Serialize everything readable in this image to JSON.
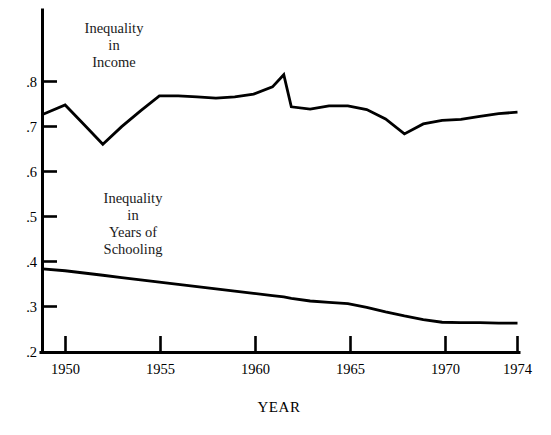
{
  "chart_data": {
    "type": "line",
    "title": "",
    "xlabel": "YEAR",
    "ylabel": "",
    "grid": false,
    "legend_position": "inline-annotation",
    "xlim": [
      1948.8,
      1974
    ],
    "ylim": [
      0.2,
      0.85
    ],
    "x_ticks": [
      1950,
      1955,
      1960,
      1965,
      1970,
      1974
    ],
    "x_tick_labels": [
      "1950",
      "1955",
      "1960",
      "1965",
      "1970",
      "1974"
    ],
    "y_ticks": [
      0.2,
      0.3,
      0.4,
      0.5,
      0.6,
      0.7,
      0.8
    ],
    "y_tick_labels": [
      ".2",
      ".3",
      ".4",
      ".5",
      ".6",
      ".7",
      ".8"
    ],
    "x": [
      1948.8,
      1950,
      1951,
      1952,
      1953,
      1954,
      1955,
      1956,
      1957,
      1958,
      1959,
      1960,
      1961,
      1961.6,
      1962,
      1963,
      1964,
      1965,
      1966,
      1967,
      1968,
      1969,
      1970,
      1971,
      1972,
      1973,
      1974
    ],
    "series": [
      {
        "name": "Inequality in Income",
        "annotation": "Inequality\nin\nIncome",
        "values": [
          0.727,
          0.748,
          0.705,
          0.661,
          0.7,
          0.735,
          0.768,
          0.768,
          0.766,
          0.763,
          0.766,
          0.772,
          0.788,
          0.815,
          0.744,
          0.739,
          0.746,
          0.746,
          0.738,
          0.717,
          0.684,
          0.706,
          0.714,
          0.716,
          0.723,
          0.729,
          0.732
        ]
      },
      {
        "name": "Inequality in Years of Schooling",
        "annotation": "Inequality\nin\nYears of\nSchooling",
        "values": [
          0.385,
          0.381,
          0.376,
          0.371,
          0.366,
          0.361,
          0.356,
          0.351,
          0.346,
          0.341,
          0.336,
          0.331,
          0.326,
          0.323,
          0.32,
          0.314,
          0.311,
          0.308,
          0.3,
          0.29,
          0.281,
          0.273,
          0.267,
          0.266,
          0.266,
          0.265,
          0.265
        ]
      }
    ]
  },
  "annotations": {
    "income_label": [
      "Inequality",
      "in",
      "Income"
    ],
    "schooling_label": [
      "Inequality",
      "in",
      "Years of",
      "Schooling"
    ]
  },
  "axes": {
    "x_axis_title": "YEAR"
  }
}
